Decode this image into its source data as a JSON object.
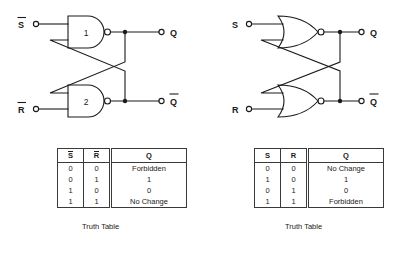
{
  "figure": {
    "left_circuit": {
      "name": "nand-sr-latch",
      "inputs": [
        {
          "label": "S",
          "overbar": true,
          "position": "top-left"
        },
        {
          "label": "R",
          "overbar": true,
          "position": "bottom-left"
        }
      ],
      "outputs": [
        {
          "label": "Q",
          "overbar": false,
          "position": "top-right"
        },
        {
          "label": "Q",
          "overbar": true,
          "position": "bottom-right"
        }
      ],
      "gates": [
        {
          "type": "NAND",
          "number": "1"
        },
        {
          "type": "NAND",
          "number": "2"
        }
      ]
    },
    "right_circuit": {
      "name": "nor-sr-latch",
      "inputs": [
        {
          "label": "S",
          "overbar": false,
          "position": "top-left"
        },
        {
          "label": "R",
          "overbar": false,
          "position": "bottom-left"
        }
      ],
      "outputs": [
        {
          "label": "Q",
          "overbar": false,
          "position": "top-right"
        },
        {
          "label": "Q",
          "overbar": true,
          "position": "bottom-right"
        }
      ],
      "gates": [
        {
          "type": "NOR",
          "number": ""
        },
        {
          "type": "NOR",
          "number": ""
        }
      ]
    }
  },
  "tables": [
    {
      "id": "nand-truth-table",
      "caption": "Truth Table",
      "headers": [
        {
          "text": "S",
          "overbar": true
        },
        {
          "text": "R",
          "overbar": true
        },
        {
          "text": "Q",
          "overbar": false
        }
      ],
      "rows": [
        [
          "0",
          "0",
          "Forbidden"
        ],
        [
          "0",
          "1",
          "1"
        ],
        [
          "1",
          "0",
          "0"
        ],
        [
          "1",
          "1",
          "No Change"
        ]
      ]
    },
    {
      "id": "nor-truth-table",
      "caption": "Truth Table",
      "headers": [
        {
          "text": "S",
          "overbar": false
        },
        {
          "text": "R",
          "overbar": false
        },
        {
          "text": "Q",
          "overbar": false
        }
      ],
      "rows": [
        [
          "0",
          "0",
          "No Change"
        ],
        [
          "1",
          "0",
          "1"
        ],
        [
          "0",
          "1",
          "0"
        ],
        [
          "1",
          "1",
          "Forbidden"
        ]
      ]
    }
  ],
  "colors": {
    "ink": "#1a1a1a",
    "line": "#3a3a3a",
    "background": "#ffffff"
  }
}
